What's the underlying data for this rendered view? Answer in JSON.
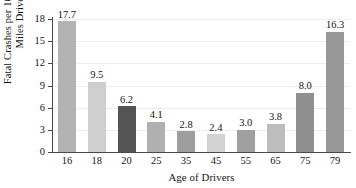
{
  "chart_data": {
    "type": "bar",
    "title": "",
    "xlabel": "Age of Drivers",
    "ylabel_line1": "Fatal Crashes per 100 Million",
    "ylabel_line2": "Miles Driven",
    "categories": [
      "16",
      "18",
      "20",
      "25",
      "35",
      "45",
      "55",
      "65",
      "75",
      "79"
    ],
    "values": [
      17.7,
      9.5,
      6.2,
      4.1,
      2.8,
      2.4,
      3.0,
      3.8,
      8.0,
      16.3
    ],
    "value_labels": [
      "17.7",
      "9.5",
      "6.2",
      "4.1",
      "2.8",
      "2.4",
      "3.0",
      "3.8",
      "8.0",
      "16.3"
    ],
    "bar_colors": [
      "#b3b3b3",
      "#cfcfcf",
      "#545454",
      "#b0b0b0",
      "#9e9e9e",
      "#d2d2d2",
      "#a0a0a0",
      "#bdbdbd",
      "#8f8f8f",
      "#989898"
    ],
    "ylim": [
      0,
      18
    ],
    "yticks": [
      "0",
      "3",
      "6",
      "9",
      "12",
      "15",
      "18"
    ],
    "ytick_values": [
      0,
      3,
      6,
      9,
      12,
      15,
      18
    ],
    "grid": true,
    "legend": "none",
    "axis_color": "#4a4a4a",
    "grid_color": "#ededed",
    "background": "#ffffff",
    "text_color": "#141414"
  }
}
